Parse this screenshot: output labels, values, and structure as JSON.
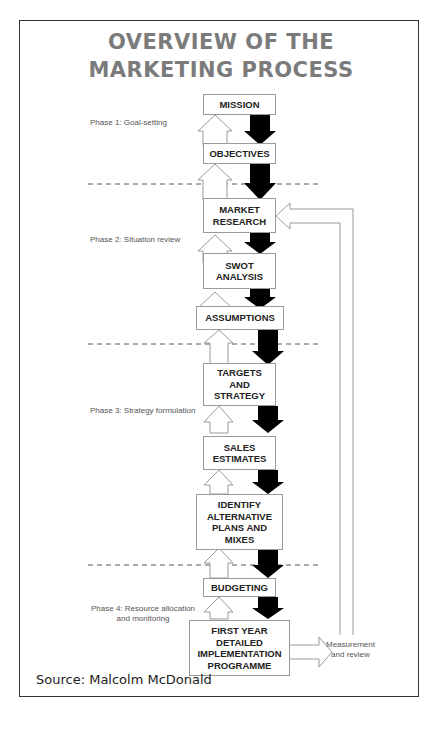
{
  "title": {
    "line1": "OVERVIEW OF THE",
    "line2": "MARKETING PROCESS"
  },
  "boxes": [
    {
      "id": "mission",
      "label": "MISSION"
    },
    {
      "id": "objectives",
      "label": "OBJECTIVES"
    },
    {
      "id": "market-research",
      "label": "MARKET\nRESEARCH"
    },
    {
      "id": "swot-analysis",
      "label": "SWOT\nANALYSIS"
    },
    {
      "id": "assumptions",
      "label": "ASSUMPTIONS"
    },
    {
      "id": "targets-and-strategy",
      "label": "TARGETS\nAND\nSTRATEGY"
    },
    {
      "id": "sales-estimates",
      "label": "SALES\nESTIMATES"
    },
    {
      "id": "identify-alternative-plans",
      "label": "IDENTIFY\nALTERNATIVE\nPLANS AND\nMIXES"
    },
    {
      "id": "budgeting",
      "label": "BUDGETING"
    },
    {
      "id": "first-year-implementation",
      "label": "FIRST YEAR\nDETAILED\nIMPLEMENTATION\nPROGRAMME"
    }
  ],
  "phases": [
    {
      "label": "Phase 1: Goal-setting"
    },
    {
      "label": "Phase 2: Situation review"
    },
    {
      "label": "Phase 3: Strategy formulation"
    },
    {
      "label": "Phase 4: Resource allocation\nand monitoring"
    }
  ],
  "feedback": {
    "label": "Measurement\nand review"
  },
  "source": "Source: Malcolm McDonald",
  "colors": {
    "title": "#7b7b7b",
    "arrow_down": "#000000",
    "arrow_up_outline": "#9a9a9a"
  }
}
